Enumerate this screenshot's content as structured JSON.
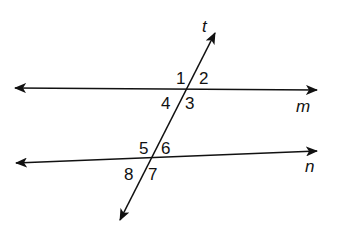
{
  "diagram": {
    "lines": {
      "m": {
        "label": "m",
        "x1": 15,
        "y1": 88,
        "x2": 317,
        "y2": 90,
        "label_x": 296,
        "label_y": 112
      },
      "n": {
        "label": "n",
        "x1": 16,
        "y1": 163,
        "x2": 317,
        "y2": 151,
        "label_x": 305,
        "label_y": 172
      },
      "t": {
        "label": "t",
        "x1": 215,
        "y1": 33,
        "x2": 120,
        "y2": 220,
        "label_x": 202,
        "label_y": 32
      }
    },
    "angles": [
      {
        "label": "1",
        "x": 176,
        "y": 84
      },
      {
        "label": "2",
        "x": 199,
        "y": 84
      },
      {
        "label": "4",
        "x": 161,
        "y": 109
      },
      {
        "label": "3",
        "x": 185,
        "y": 109
      },
      {
        "label": "5",
        "x": 139,
        "y": 154
      },
      {
        "label": "6",
        "x": 161,
        "y": 154
      },
      {
        "label": "8",
        "x": 124,
        "y": 180
      },
      {
        "label": "7",
        "x": 148,
        "y": 180
      }
    ],
    "colors": {
      "stroke": "#111111",
      "background": "#ffffff"
    }
  }
}
